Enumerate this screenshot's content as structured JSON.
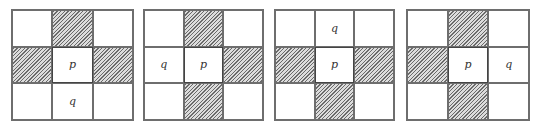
{
  "figure": {
    "colors": {
      "border": "#6e6e6e",
      "hatch_dark": "#6a6a6a",
      "hatch_light": "#dcdcdc",
      "background": "#ffffff"
    },
    "panels": [
      {
        "cells": [
          {
            "label": "",
            "hatched": false
          },
          {
            "label": "",
            "hatched": true
          },
          {
            "label": "",
            "hatched": false
          },
          {
            "label": "",
            "hatched": true
          },
          {
            "label": "p",
            "hatched": false
          },
          {
            "label": "",
            "hatched": true
          },
          {
            "label": "",
            "hatched": false
          },
          {
            "label": "q",
            "hatched": false
          },
          {
            "label": "",
            "hatched": false
          }
        ]
      },
      {
        "cells": [
          {
            "label": "",
            "hatched": false
          },
          {
            "label": "",
            "hatched": true
          },
          {
            "label": "",
            "hatched": false
          },
          {
            "label": "q",
            "hatched": false
          },
          {
            "label": "p",
            "hatched": false
          },
          {
            "label": "",
            "hatched": true
          },
          {
            "label": "",
            "hatched": false
          },
          {
            "label": "",
            "hatched": true
          },
          {
            "label": "",
            "hatched": false
          }
        ]
      },
      {
        "cells": [
          {
            "label": "",
            "hatched": false
          },
          {
            "label": "q",
            "hatched": false
          },
          {
            "label": "",
            "hatched": false
          },
          {
            "label": "",
            "hatched": true
          },
          {
            "label": "p",
            "hatched": false
          },
          {
            "label": "",
            "hatched": true
          },
          {
            "label": "",
            "hatched": false
          },
          {
            "label": "",
            "hatched": true
          },
          {
            "label": "",
            "hatched": false
          }
        ]
      },
      {
        "cells": [
          {
            "label": "",
            "hatched": false
          },
          {
            "label": "",
            "hatched": true
          },
          {
            "label": "",
            "hatched": false
          },
          {
            "label": "",
            "hatched": true
          },
          {
            "label": "p",
            "hatched": false
          },
          {
            "label": "q",
            "hatched": false
          },
          {
            "label": "",
            "hatched": false
          },
          {
            "label": "",
            "hatched": true
          },
          {
            "label": "",
            "hatched": false
          }
        ]
      }
    ]
  }
}
